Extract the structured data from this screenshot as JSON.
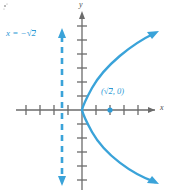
{
  "figure": {
    "type": "math-graph",
    "background": "#ffffff",
    "axis_color": "#6b6b6b",
    "curve_color": "#3aa3d9",
    "accent_color": "#2e9bd6"
  },
  "axes": {
    "x_label": "x",
    "y_label": "y",
    "origin": {
      "x": 82,
      "y": 110
    },
    "tick_spacing": 14,
    "x_ticks": [
      -4,
      -3,
      -2,
      -1,
      1,
      2,
      3,
      4
    ],
    "y_ticks": [
      -6,
      -5,
      -4,
      -3,
      -2,
      -1,
      1,
      2,
      3,
      4,
      5
    ],
    "x_range": [
      -4.7,
      6.0
    ],
    "y_range": [
      -5.8,
      7.6
    ],
    "grid": false
  },
  "directrix": {
    "label_prefix": "x = −",
    "label_radicand": "2",
    "equation_text": "x = −√2",
    "x_value": -1.41,
    "style": "dashed",
    "arrows": "both"
  },
  "focus_point": {
    "label_open": "(",
    "label_radicand": "2",
    "label_close": ", 0)",
    "point_text": "(√2, 0)",
    "x": 1.41,
    "y": 0
  },
  "curve": {
    "kind": "parabola",
    "opens": "right",
    "vertex": [
      0,
      0
    ],
    "equation": "y² = 4√2 x",
    "arrows": "both-ends"
  },
  "artifact": {
    "visible": true
  }
}
